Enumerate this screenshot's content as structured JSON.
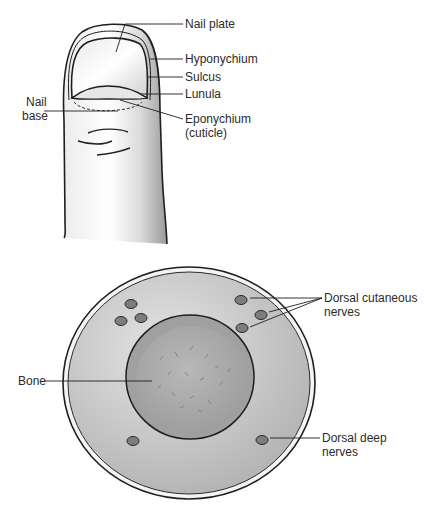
{
  "figure": {
    "finger_diagram": {
      "labels": {
        "nail_plate": "Nail plate",
        "hyponychium": "Hyponychium",
        "sulcus": "Sulcus",
        "lunula": "Lunula",
        "eponychium_line1": "Eponychium",
        "eponychium_line2": "(cuticle)",
        "nail_base_line1": "Nail",
        "nail_base_line2": "base"
      }
    },
    "cross_section_diagram": {
      "labels": {
        "bone": "Bone",
        "dorsal_cutaneous_line1": "Dorsal cutaneous",
        "dorsal_cutaneous_line2": "nerves",
        "dorsal_deep_line1": "Dorsal deep",
        "dorsal_deep_line2": "nerves"
      }
    },
    "colors": {
      "background": "#ffffff",
      "outline": "#1e1e1e",
      "skin": "#f2f2f2",
      "tissue": "#c9c9c9",
      "bone": "#a9a9a9",
      "nerve": "#7d7d7d",
      "text": "#2b2b2b"
    }
  }
}
